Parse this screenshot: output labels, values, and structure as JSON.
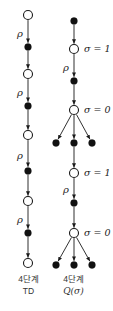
{
  "colors": {
    "background": "#ffffff",
    "stroke": "#1a1a1a",
    "state_fill": "#ffffff",
    "action_fill": "#111111",
    "label_text": "#222222",
    "caption_text": "#333333"
  },
  "diagrams": [
    {
      "id": "n-step-td",
      "caption": [
        "4단계",
        "TD"
      ],
      "nodes": [
        {
          "id": "s0",
          "kind": "state",
          "x": 28,
          "y": 15
        },
        {
          "id": "a0",
          "kind": "action",
          "x": 28,
          "y": 47
        },
        {
          "id": "s1",
          "kind": "state",
          "x": 28,
          "y": 74
        },
        {
          "id": "a1",
          "kind": "action",
          "x": 28,
          "y": 106
        },
        {
          "id": "s2",
          "kind": "state",
          "x": 28,
          "y": 135
        },
        {
          "id": "a2",
          "kind": "action",
          "x": 28,
          "y": 171
        },
        {
          "id": "s3",
          "kind": "state",
          "x": 28,
          "y": 201
        },
        {
          "id": "a3",
          "kind": "action",
          "x": 28,
          "y": 233
        },
        {
          "id": "s4",
          "kind": "state",
          "x": 28,
          "y": 263
        }
      ],
      "edges": [
        {
          "from": "s0",
          "to": "a0",
          "label": "ρ"
        },
        {
          "from": "a0",
          "to": "s1"
        },
        {
          "from": "s1",
          "to": "a1",
          "label": "ρ"
        },
        {
          "from": "a1",
          "to": "s2"
        },
        {
          "from": "s2",
          "to": "a2",
          "label": "ρ"
        },
        {
          "from": "a2",
          "to": "s3"
        },
        {
          "from": "s3",
          "to": "a3",
          "label": "ρ"
        },
        {
          "from": "a3",
          "to": "s4"
        }
      ],
      "side_labels": []
    },
    {
      "id": "n-step-q-sigma",
      "caption": [
        "4단계",
        "Q(σ)"
      ],
      "nodes": [
        {
          "id": "a0",
          "kind": "action",
          "x": 74,
          "y": 21
        },
        {
          "id": "s1",
          "kind": "state",
          "x": 74,
          "y": 49
        },
        {
          "id": "a1",
          "kind": "action",
          "x": 74,
          "y": 81
        },
        {
          "id": "s2",
          "kind": "state",
          "x": 74,
          "y": 110
        },
        {
          "id": "b1l",
          "kind": "action",
          "x": 56,
          "y": 143
        },
        {
          "id": "a2",
          "kind": "action",
          "x": 74,
          "y": 143
        },
        {
          "id": "b1r",
          "kind": "action",
          "x": 92,
          "y": 143
        },
        {
          "id": "s3",
          "kind": "state",
          "x": 74,
          "y": 173
        },
        {
          "id": "a3",
          "kind": "action",
          "x": 74,
          "y": 203
        },
        {
          "id": "s4",
          "kind": "state",
          "x": 74,
          "y": 233
        },
        {
          "id": "b2l",
          "kind": "action",
          "x": 56,
          "y": 265
        },
        {
          "id": "a4",
          "kind": "action",
          "x": 74,
          "y": 265
        },
        {
          "id": "b2r",
          "kind": "action",
          "x": 92,
          "y": 265
        }
      ],
      "edges": [
        {
          "from": "a0",
          "to": "s1"
        },
        {
          "from": "s1",
          "to": "a1",
          "label": "ρ"
        },
        {
          "from": "a1",
          "to": "s2"
        },
        {
          "from": "s2",
          "to": "b1l"
        },
        {
          "from": "s2",
          "to": "a2"
        },
        {
          "from": "s2",
          "to": "b1r"
        },
        {
          "from": "a2",
          "to": "s3"
        },
        {
          "from": "s3",
          "to": "a3",
          "label": "ρ"
        },
        {
          "from": "a3",
          "to": "s4"
        },
        {
          "from": "s4",
          "to": "b2l"
        },
        {
          "from": "s4",
          "to": "a4"
        },
        {
          "from": "s4",
          "to": "b2r"
        }
      ],
      "side_labels": [
        {
          "node": "s1",
          "text": "σ = 1"
        },
        {
          "node": "s2",
          "text": "σ = 0"
        },
        {
          "node": "s3",
          "text": "σ = 1"
        },
        {
          "node": "s4",
          "text": "σ = 0"
        }
      ]
    }
  ]
}
